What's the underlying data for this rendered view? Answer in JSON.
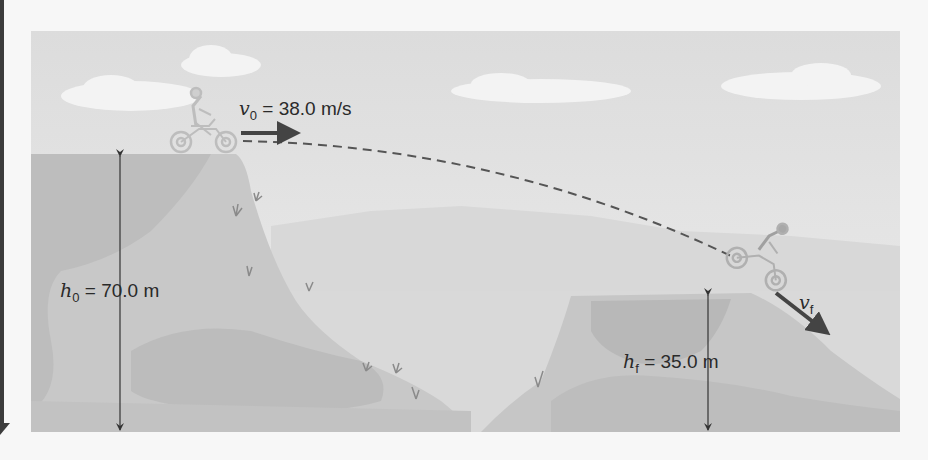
{
  "figure": {
    "initial_velocity": {
      "symbol": "v",
      "subscript": "0",
      "equals": "=",
      "value": "38.0 m/s"
    },
    "final_velocity": {
      "symbol": "v",
      "subscript": "f"
    },
    "initial_height": {
      "symbol": "h",
      "subscript": "0",
      "equals": "=",
      "value": "70.0 m"
    },
    "final_height": {
      "symbol": "h",
      "subscript": "f",
      "equals": "=",
      "value": "35.0 m"
    }
  },
  "colors": {
    "sky": "#e4e4e4",
    "cloud": "#f2f2f2",
    "far_hills": "#d6d6d6",
    "cliff_light": "#cbcbcb",
    "cliff_dark": "#b9b9b9",
    "arrow": "#444444",
    "trajectory": "#555555"
  }
}
